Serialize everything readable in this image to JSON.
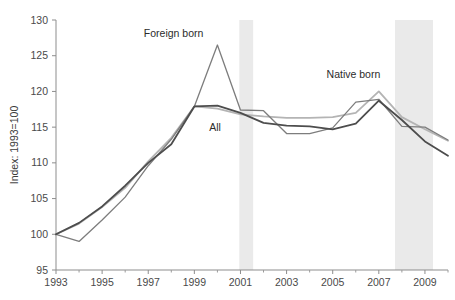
{
  "chart_data": {
    "type": "line",
    "title": "",
    "subtitle": "",
    "xlabel": "",
    "ylabel": "Index: 1993=100",
    "ylim": [
      95,
      130
    ],
    "yticks": [
      95,
      100,
      105,
      110,
      115,
      120,
      125,
      130
    ],
    "xlim": [
      1993,
      2010
    ],
    "xticks": [
      1993,
      1995,
      1997,
      1999,
      2001,
      2003,
      2005,
      2007,
      2009
    ],
    "xticks_minor": [
      1994,
      1996,
      1998,
      2000,
      2002,
      2004,
      2006,
      2008,
      2010
    ],
    "grid": false,
    "legend_position": "inline-annotations",
    "x": [
      1993,
      1994,
      1995,
      1996,
      1997,
      1998,
      1999,
      2000,
      2001,
      2002,
      2003,
      2004,
      2005,
      2006,
      2007,
      2008,
      2009,
      2010
    ],
    "series": [
      {
        "name": "All",
        "label": "All",
        "color": "#4d4d4d",
        "width": 1.8,
        "values": [
          100.0,
          101.6,
          103.9,
          106.8,
          110.0,
          112.6,
          117.9,
          118.0,
          117.0,
          115.6,
          115.2,
          115.1,
          114.7,
          115.5,
          118.7,
          116.0,
          113.0,
          111.0
        ],
        "label_x": 1999.9,
        "label_y": 114.4
      },
      {
        "name": "Foreign born",
        "label": "Foreign born",
        "color": "#7d7d7d",
        "width": 1.3,
        "values": [
          100.0,
          99.0,
          102.0,
          105.2,
          109.6,
          113.3,
          117.9,
          126.5,
          117.4,
          117.3,
          114.1,
          114.1,
          114.9,
          118.5,
          118.9,
          115.1,
          115.0,
          113.2
        ],
        "label_x": 1998.1,
        "label_y": 127.6
      },
      {
        "name": "Native born",
        "label": "Native born",
        "color": "#b4b4b4",
        "width": 1.8,
        "values": [
          100.0,
          101.5,
          103.8,
          106.5,
          110.2,
          113.5,
          117.9,
          117.6,
          116.8,
          116.5,
          116.3,
          116.3,
          116.4,
          117.0,
          120.0,
          116.4,
          114.7,
          113.1
        ],
        "label_x": 2005.9,
        "label_y": 121.9
      }
    ],
    "shaded_bands": [
      {
        "name": "recession-2001",
        "x_start": 2000.95,
        "x_end": 2001.55,
        "color": "#eaeaea"
      },
      {
        "name": "recession-2008",
        "x_start": 2007.7,
        "x_end": 2009.35,
        "color": "#eaeaea"
      }
    ]
  }
}
